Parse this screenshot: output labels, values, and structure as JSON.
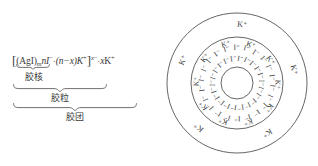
{
  "figure": {
    "background_color": "#ffffff",
    "ink_color": "#3a3a3a"
  },
  "formula": {
    "open_bracket": "[",
    "core_compound": "(AgI)",
    "core_subscript": "m",
    "adsorbed_ion": "nI",
    "adsorbed_ion_charge": "−",
    "adsorbed_ion_count": "n",
    "middot_1": "·",
    "counter_ion_group": "(n−x)K",
    "counter_ion_charge": "+",
    "close_bracket": "]",
    "bracket_charge_number": "x",
    "bracket_charge_sign": "−",
    "middot_2": "·",
    "diffuse_ion_count": "x",
    "diffuse_ion": "K",
    "diffuse_ion_charge": "+",
    "full_text": "[(AgI)m·nI⁻·(n−x)K⁺]ˣ⁻·xK⁺"
  },
  "braces": [
    {
      "id": "nucleus",
      "label": "胶核"
    },
    {
      "id": "particle",
      "label": "胶粒"
    },
    {
      "id": "micelle",
      "label": "胶团"
    }
  ],
  "micelle": {
    "core_label": "AgI",
    "inner_ion_label": "I⁻",
    "inner_ion_count": 22,
    "middle_ion_label": "K⁺",
    "middle_ion_count": 10,
    "outer_ion_label": "K⁺",
    "outer_ion_count": 5,
    "rings": [
      {
        "id": "core-circle",
        "r": 16
      },
      {
        "id": "adsorption-layer-circle",
        "r": 46
      },
      {
        "id": "diffuse-layer-circle",
        "r": 70
      }
    ]
  }
}
